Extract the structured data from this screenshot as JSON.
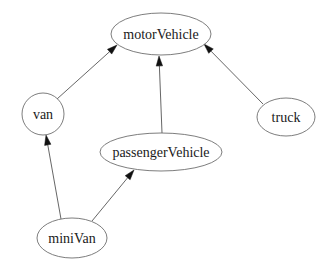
{
  "diagram": {
    "type": "class-hierarchy",
    "nodes": [
      {
        "id": "motorVehicle",
        "label": "motorVehicle",
        "cx": 161,
        "cy": 34,
        "rx": 50,
        "ry": 21
      },
      {
        "id": "van",
        "label": "van",
        "cx": 43,
        "cy": 114,
        "rx": 21,
        "ry": 21
      },
      {
        "id": "passengerVehicle",
        "label": "passengerVehicle",
        "cx": 161,
        "cy": 152,
        "rx": 61,
        "ry": 19
      },
      {
        "id": "truck",
        "label": "truck",
        "cx": 286,
        "cy": 117,
        "rx": 29,
        "ry": 19
      },
      {
        "id": "miniVan",
        "label": "miniVan",
        "cx": 72,
        "cy": 238,
        "rx": 35,
        "ry": 20
      }
    ],
    "edges": [
      {
        "from": "van",
        "to": "motorVehicle",
        "x1": 57,
        "y1": 99,
        "x2": 117,
        "y2": 45
      },
      {
        "from": "passengerVehicle",
        "to": "motorVehicle",
        "x1": 162,
        "y1": 133,
        "x2": 159,
        "y2": 56
      },
      {
        "from": "truck",
        "to": "motorVehicle",
        "x1": 263,
        "y1": 104,
        "x2": 204,
        "y2": 44
      },
      {
        "from": "miniVan",
        "to": "van",
        "x1": 61,
        "y1": 219,
        "x2": 46,
        "y2": 135
      },
      {
        "from": "miniVan",
        "to": "passengerVehicle",
        "x1": 92,
        "y1": 221,
        "x2": 134,
        "y2": 170
      }
    ]
  },
  "colors": {
    "background": "#ffffff",
    "node_stroke": "#6e6e6e",
    "edge_stroke": "#555555",
    "arrow_fill": "#111111",
    "text": "#1a1a1a"
  }
}
